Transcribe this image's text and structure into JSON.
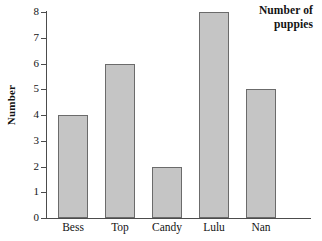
{
  "chart_data": {
    "type": "bar",
    "title": "Number of puppies",
    "title_lines": [
      "Number of",
      "puppies"
    ],
    "xlabel": "",
    "ylabel": "Number",
    "categories": [
      "Bess",
      "Top",
      "Candy",
      "Lulu",
      "Nan"
    ],
    "values": [
      4,
      6,
      2,
      8,
      5
    ],
    "ylim": [
      0,
      8
    ],
    "ytick_labels": [
      "0",
      "1",
      "2",
      "3",
      "4",
      "5",
      "6",
      "7",
      "8"
    ],
    "ytick_values": [
      0,
      1,
      2,
      3,
      4,
      5,
      6,
      7,
      8
    ],
    "grid": false,
    "legend": false,
    "bar_fill_color": "#c5c5c5",
    "bar_edge_color": "#6b6b6b",
    "axis_color": "#4c4c4c",
    "background_color": "#ffffff"
  }
}
